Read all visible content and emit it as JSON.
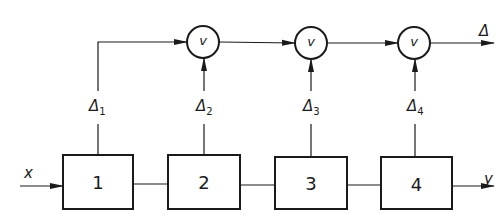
{
  "diagram": {
    "input_label": "x",
    "output_label": "y",
    "final_output_label": "Δ",
    "stroke_color": "#1a1a1a",
    "blocks": [
      {
        "label": "1"
      },
      {
        "label": "2"
      },
      {
        "label": "3"
      },
      {
        "label": "4"
      }
    ],
    "gates": [
      {
        "label": "v"
      },
      {
        "label": "v"
      },
      {
        "label": "v"
      }
    ],
    "signals": [
      {
        "symbol": "Δ",
        "sub": "1"
      },
      {
        "symbol": "Δ",
        "sub": "2"
      },
      {
        "symbol": "Δ",
        "sub": "3"
      },
      {
        "symbol": "Δ",
        "sub": "4"
      }
    ]
  }
}
